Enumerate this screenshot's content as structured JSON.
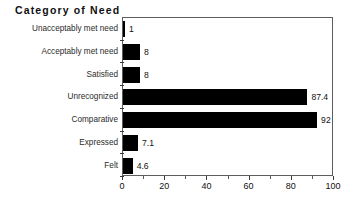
{
  "chart_data": {
    "type": "bar",
    "orientation": "horizontal",
    "title": "Category of Need",
    "xlabel": "",
    "ylabel": "",
    "categories": [
      "Unacceptably met need",
      "Acceptably met need",
      "Satisfied",
      "Unrecognized",
      "Comparative",
      "Expressed",
      "Felt"
    ],
    "values": [
      1,
      8,
      8,
      87.4,
      92,
      7.1,
      4.6
    ],
    "value_labels": [
      "1",
      "8",
      "8",
      "87.4",
      "92",
      "7.1",
      "4.6"
    ],
    "xlim": [
      0,
      100
    ],
    "xticks": [
      0,
      20,
      40,
      60,
      80,
      100
    ],
    "xtick_labels": [
      "0",
      "20",
      "40",
      "60",
      "80",
      "100"
    ],
    "x_minor_ticks": [
      10,
      30,
      50,
      70,
      90
    ],
    "grid": false,
    "legend": null,
    "bar_color": "#000000",
    "background_color": "#ffffff",
    "frame_color": "#5d5d5d"
  }
}
